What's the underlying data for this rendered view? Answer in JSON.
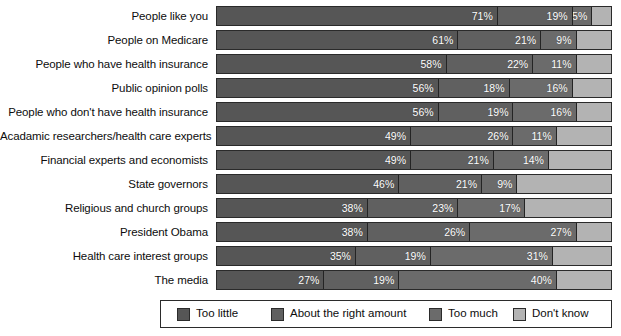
{
  "chart_data": {
    "type": "bar",
    "subtype": "horizontal-stacked-100",
    "title": "",
    "subtitle": "",
    "xlabel": "",
    "ylabel": "",
    "xlim": [
      0,
      100
    ],
    "grid": false,
    "legend_position": "bottom",
    "value_suffix": "%",
    "categories": [
      "People like you",
      "People on Medicare",
      "People who have health insurance",
      "Public opinion polls",
      "People who don't have health insurance",
      "Acadamic researchers/health care experts",
      "Financial experts and economists",
      "State governors",
      "Religious and church groups",
      "President Obama",
      "Health care interest groups",
      "The media"
    ],
    "series": [
      {
        "name": "Too little",
        "color": "#565656",
        "values": [
          71,
          61,
          58,
          56,
          56,
          49,
          49,
          46,
          38,
          38,
          35,
          27
        ]
      },
      {
        "name": "About the right amount",
        "color": "#606060",
        "values": [
          19,
          21,
          22,
          18,
          19,
          26,
          21,
          21,
          23,
          26,
          19,
          19
        ]
      },
      {
        "name": "Too much",
        "color": "#6b6b6b",
        "values": [
          5,
          9,
          11,
          16,
          16,
          11,
          14,
          9,
          17,
          27,
          31,
          40
        ]
      },
      {
        "name": "Don't know",
        "color": "#b3b3b3",
        "values": [
          5,
          9,
          9,
          10,
          9,
          14,
          16,
          24,
          22,
          9,
          15,
          14
        ]
      }
    ],
    "rows": [
      {
        "label": "People like you",
        "segments": [
          {
            "series": "Too little",
            "value": 71,
            "label": "71%",
            "show_label": true
          },
          {
            "series": "About the right amount",
            "value": 19,
            "label": "19%",
            "show_label": true
          },
          {
            "series": "Too much",
            "value": 5,
            "label": "5%",
            "show_label": true
          },
          {
            "series": "Don't know",
            "value": 5,
            "label": "",
            "show_label": false
          }
        ]
      },
      {
        "label": "People on Medicare",
        "segments": [
          {
            "series": "Too little",
            "value": 61,
            "label": "61%",
            "show_label": true
          },
          {
            "series": "About the right amount",
            "value": 21,
            "label": "21%",
            "show_label": true
          },
          {
            "series": "Too much",
            "value": 9,
            "label": "9%",
            "show_label": true
          },
          {
            "series": "Don't know",
            "value": 9,
            "label": "",
            "show_label": false
          }
        ]
      },
      {
        "label": "People who have health insurance",
        "segments": [
          {
            "series": "Too little",
            "value": 58,
            "label": "58%",
            "show_label": true
          },
          {
            "series": "About the right amount",
            "value": 22,
            "label": "22%",
            "show_label": true
          },
          {
            "series": "Too much",
            "value": 11,
            "label": "11%",
            "show_label": true
          },
          {
            "series": "Don't know",
            "value": 9,
            "label": "",
            "show_label": false
          }
        ]
      },
      {
        "label": "Public opinion polls",
        "segments": [
          {
            "series": "Too little",
            "value": 56,
            "label": "56%",
            "show_label": true
          },
          {
            "series": "About the right amount",
            "value": 18,
            "label": "18%",
            "show_label": true
          },
          {
            "series": "Too much",
            "value": 16,
            "label": "16%",
            "show_label": true
          },
          {
            "series": "Don't know",
            "value": 10,
            "label": "",
            "show_label": false
          }
        ]
      },
      {
        "label": "People who don't have health insurance",
        "segments": [
          {
            "series": "Too little",
            "value": 56,
            "label": "56%",
            "show_label": true
          },
          {
            "series": "About the right amount",
            "value": 19,
            "label": "19%",
            "show_label": true
          },
          {
            "series": "Too much",
            "value": 16,
            "label": "16%",
            "show_label": true
          },
          {
            "series": "Don't know",
            "value": 9,
            "label": "",
            "show_label": false
          }
        ]
      },
      {
        "label": "Acadamic researchers/health care experts",
        "segments": [
          {
            "series": "Too little",
            "value": 49,
            "label": "49%",
            "show_label": true
          },
          {
            "series": "About the right amount",
            "value": 26,
            "label": "26%",
            "show_label": true
          },
          {
            "series": "Too much",
            "value": 11,
            "label": "11%",
            "show_label": true
          },
          {
            "series": "Don't know",
            "value": 14,
            "label": "",
            "show_label": false
          }
        ]
      },
      {
        "label": "Financial experts and economists",
        "segments": [
          {
            "series": "Too little",
            "value": 49,
            "label": "49%",
            "show_label": true
          },
          {
            "series": "About the right amount",
            "value": 21,
            "label": "21%",
            "show_label": true
          },
          {
            "series": "Too much",
            "value": 14,
            "label": "14%",
            "show_label": true
          },
          {
            "series": "Don't know",
            "value": 16,
            "label": "",
            "show_label": false
          }
        ]
      },
      {
        "label": "State governors",
        "segments": [
          {
            "series": "Too little",
            "value": 46,
            "label": "46%",
            "show_label": true
          },
          {
            "series": "About the right amount",
            "value": 21,
            "label": "21%",
            "show_label": true
          },
          {
            "series": "Too much",
            "value": 9,
            "label": "9%",
            "show_label": true
          },
          {
            "series": "Don't know",
            "value": 24,
            "label": "",
            "show_label": false
          }
        ]
      },
      {
        "label": "Religious and church groups",
        "segments": [
          {
            "series": "Too little",
            "value": 38,
            "label": "38%",
            "show_label": true
          },
          {
            "series": "About the right amount",
            "value": 23,
            "label": "23%",
            "show_label": true
          },
          {
            "series": "Too much",
            "value": 17,
            "label": "17%",
            "show_label": true
          },
          {
            "series": "Don't know",
            "value": 22,
            "label": "",
            "show_label": false
          }
        ]
      },
      {
        "label": "President Obama",
        "segments": [
          {
            "series": "Too little",
            "value": 38,
            "label": "38%",
            "show_label": true
          },
          {
            "series": "About the right amount",
            "value": 26,
            "label": "26%",
            "show_label": true
          },
          {
            "series": "Too much",
            "value": 27,
            "label": "27%",
            "show_label": true
          },
          {
            "series": "Don't know",
            "value": 9,
            "label": "",
            "show_label": false
          }
        ]
      },
      {
        "label": "Health care interest groups",
        "segments": [
          {
            "series": "Too little",
            "value": 35,
            "label": "35%",
            "show_label": true
          },
          {
            "series": "About the right amount",
            "value": 19,
            "label": "19%",
            "show_label": true
          },
          {
            "series": "Too much",
            "value": 31,
            "label": "31%",
            "show_label": true
          },
          {
            "series": "Don't know",
            "value": 15,
            "label": "",
            "show_label": false
          }
        ]
      },
      {
        "label": "The media",
        "segments": [
          {
            "series": "Too little",
            "value": 27,
            "label": "27%",
            "show_label": true
          },
          {
            "series": "About the right amount",
            "value": 19,
            "label": "19%",
            "show_label": true
          },
          {
            "series": "Too much",
            "value": 40,
            "label": "40%",
            "show_label": true
          },
          {
            "series": "Don't know",
            "value": 14,
            "label": "",
            "show_label": false
          }
        ]
      }
    ],
    "legend": [
      {
        "label": "Too little",
        "color": "#565656",
        "x": 16
      },
      {
        "label": "About the right amount",
        "color": "#606060",
        "x": 110
      },
      {
        "label": "Too much",
        "color": "#6b6b6b",
        "x": 268
      },
      {
        "label": "Don't know",
        "color": "#b3b3b3",
        "x": 352
      }
    ]
  }
}
